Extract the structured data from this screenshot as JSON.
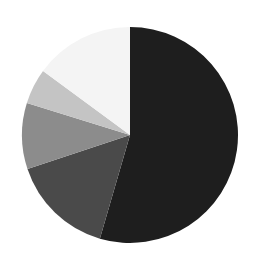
{
  "chart_data": {
    "type": "pie",
    "title": "",
    "legend": null,
    "labels_shown": false,
    "start_angle_deg": 90,
    "direction": "clockwise",
    "slices": [
      {
        "label": "Slice 1",
        "value": 54.5,
        "color": "#1e1e1e"
      },
      {
        "label": "Slice 2",
        "value": 15.4,
        "color": "#4a4a4a"
      },
      {
        "label": "Slice 3",
        "value": 9.9,
        "color": "#8c8c8c"
      },
      {
        "label": "Slice 4",
        "value": 5.3,
        "color": "#c4c4c4"
      },
      {
        "label": "Slice 5",
        "value": 14.9,
        "color": "#f4f4f4"
      }
    ],
    "values": [
      54.5,
      15.4,
      9.9,
      5.3,
      14.9
    ],
    "categories": [
      "Slice 1",
      "Slice 2",
      "Slice 3",
      "Slice 4",
      "Slice 5"
    ]
  },
  "layout": {
    "cx": 130,
    "cy": 135,
    "r": 108
  }
}
